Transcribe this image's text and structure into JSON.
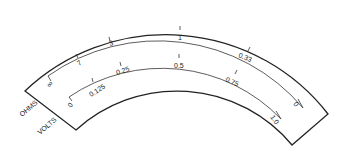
{
  "diagram": {
    "colors": {
      "line": "#222222",
      "background": "#ffffff"
    },
    "scales": [
      {
        "name": "OHMS",
        "label": "OHMS",
        "ticks": [
          "∞",
          "7",
          "3",
          "1",
          "0.33",
          "0"
        ]
      },
      {
        "name": "VOLTS",
        "label": "VOLTS",
        "ticks": [
          "0",
          "0.125",
          "0.25",
          "0.5",
          "0.75",
          "1.0"
        ]
      }
    ]
  }
}
